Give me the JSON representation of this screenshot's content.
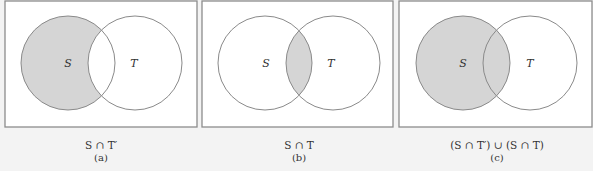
{
  "panels": [
    {
      "id": "a",
      "shaded_region": "S-only",
      "set_labels": {
        "s": "S",
        "t": "T"
      },
      "expression": "S ∩ T′",
      "sublabel": "(a)"
    },
    {
      "id": "b",
      "shaded_region": "intersection",
      "set_labels": {
        "s": "S",
        "t": "T"
      },
      "expression": "S ∩ T",
      "sublabel": "(b)"
    },
    {
      "id": "c",
      "shaded_region": "all-S",
      "set_labels": {
        "s": "S",
        "t": "T"
      },
      "expression": "(S ∩ T′) ∪ (S ∩ T)",
      "sublabel": "(c)"
    }
  ],
  "colors": {
    "shade": "#d5d5d5",
    "outline": "#8a8a8a",
    "frame": "#8c8c8c",
    "panel_bg": "#ffffff",
    "page_bg": "#f3f3f3"
  }
}
